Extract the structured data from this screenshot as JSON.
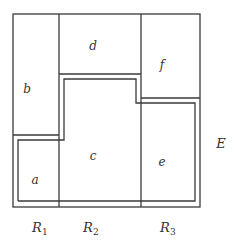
{
  "diagram": {
    "universe_label": "E",
    "regions": [
      {
        "id": "a",
        "label": "a",
        "x": 35,
        "y": 184
      },
      {
        "id": "b",
        "label": "b",
        "x": 27,
        "y": 93
      },
      {
        "id": "c",
        "label": "c",
        "x": 93,
        "y": 160
      },
      {
        "id": "d",
        "label": "d",
        "x": 93,
        "y": 50
      },
      {
        "id": "e",
        "label": "e",
        "x": 162,
        "y": 166
      },
      {
        "id": "f",
        "label": "f",
        "x": 162,
        "y": 69
      }
    ],
    "columns": [
      {
        "id": "R1",
        "base": "R",
        "sub": "1"
      },
      {
        "id": "R2",
        "base": "R",
        "sub": "2"
      },
      {
        "id": "R3",
        "base": "R",
        "sub": "3"
      }
    ],
    "colors": {
      "line": "#3a3a3a",
      "text": "#333333",
      "background": "#ffffff"
    }
  }
}
